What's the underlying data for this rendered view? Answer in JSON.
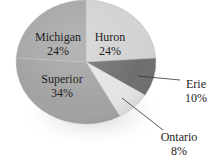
{
  "chart_data": {
    "type": "pie",
    "title": "",
    "categories": [
      "Huron",
      "Erie",
      "Ontario",
      "Superior",
      "Michigan"
    ],
    "values": [
      24,
      10,
      8,
      34,
      24
    ],
    "unit": "%",
    "style": "3D shaded grayscale pie",
    "slices": [
      {
        "name": "Huron",
        "value": 24,
        "label": "Huron",
        "pct": "24%",
        "color": "#d2d2d2"
      },
      {
        "name": "Erie",
        "value": 10,
        "label": "Erie",
        "pct": "10%",
        "color": "#6e6e6e"
      },
      {
        "name": "Ontario",
        "value": 8,
        "label": "Ontario",
        "pct": "8%",
        "color": "#e4e4e4"
      },
      {
        "name": "Superior",
        "value": 34,
        "label": "Superior",
        "pct": "34%",
        "color": "#a2a2a2"
      },
      {
        "name": "Michigan",
        "value": 24,
        "label": "Michigan",
        "pct": "24%",
        "color": "#a6a6a6"
      }
    ],
    "legend": "none (labels on/near slices; Erie and Ontario use leader lines)"
  }
}
